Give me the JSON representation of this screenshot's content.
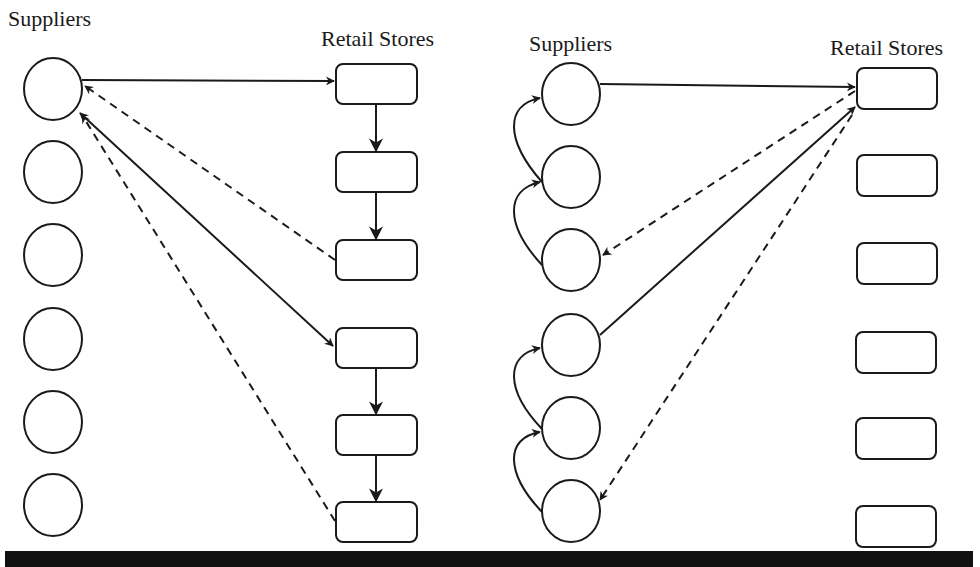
{
  "panels": [
    {
      "name": "left-panel",
      "suppliers_label": "Suppliers",
      "stores_label": "Retail Stores",
      "description": "Supplier 1 ships to first store; stores transship down chain in two groups of three; dashed return flows from store 3 and store 6 back to supplier 1; supplier 1 also ships to store 4 (bidirectional solid line)."
    },
    {
      "name": "right-panel",
      "suppliers_label": "Suppliers",
      "stores_label": "Retail Stores",
      "description": "Suppliers chained upward in two groups of three (curved arrows); supplier 1 and supplier 4 ship to store 1; dashed flows from store 1 to supplier 3 and supplier 6."
    }
  ],
  "colors": {
    "stroke": "#1a1a1a",
    "background": "#ffffff",
    "bottom_bar": "#111111"
  }
}
